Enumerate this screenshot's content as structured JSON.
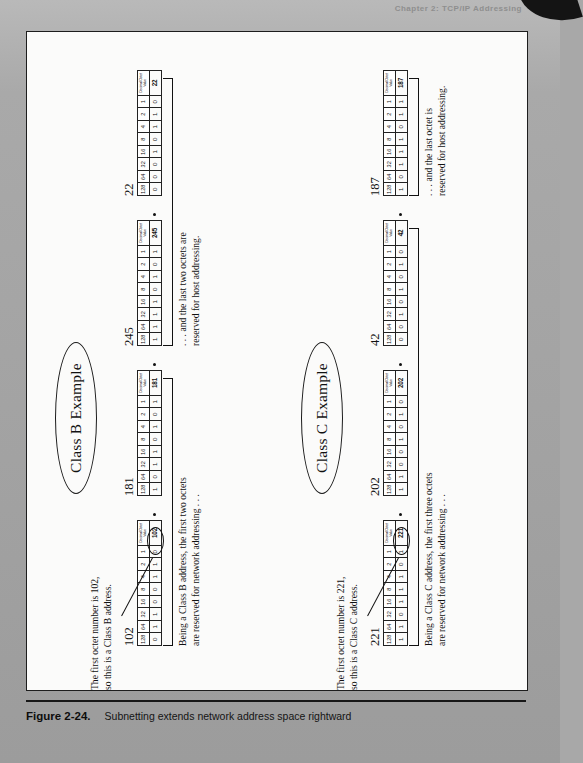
{
  "page": {
    "running_head": "Chapter 2:  TCP/IP Addressing",
    "background_color": "#a8a8a8"
  },
  "caption": {
    "figure_number": "Figure 2-24.",
    "text": "Subnetting extends network address space rightward"
  },
  "bit_header": [
    "128",
    "64",
    "32",
    "16",
    "8",
    "4",
    "2",
    "1"
  ],
  "decimal_header": "Decimal Octet Value",
  "examples": [
    {
      "id": "class-b",
      "oval_label": "Class B Example",
      "callout_note": "The first octet number is 102,\nso this is a Class B address.",
      "left_bracket_note": "Being a Class B address, the first two octets\nare reserved for network addressing . . .",
      "right_bracket_note": ". . . and the last two octets are\nreserved for host addressing.",
      "octets": [
        {
          "decimal": "102",
          "bits": [
            "0",
            "1",
            "1",
            "0",
            "0",
            "1",
            "1",
            "0"
          ],
          "highlighted": true
        },
        {
          "decimal": "181",
          "bits": [
            "1",
            "0",
            "1",
            "1",
            "0",
            "1",
            "0",
            "1"
          ],
          "highlighted": false
        },
        {
          "decimal": "245",
          "bits": [
            "1",
            "1",
            "1",
            "1",
            "0",
            "1",
            "0",
            "1"
          ],
          "highlighted": false
        },
        {
          "decimal": "22",
          "bits": [
            "0",
            "0",
            "0",
            "1",
            "0",
            "1",
            "1",
            "0"
          ],
          "highlighted": false
        }
      ],
      "network_octets": 2,
      "host_octets": 2
    },
    {
      "id": "class-c",
      "oval_label": "Class C Example",
      "callout_note": "The first octet number is 221,\nso this is a Class C address.",
      "left_bracket_note": "Being a Class C address, the first three octets\nare reserved for network addressing . . .",
      "right_bracket_note": ". . . and the last octet is\nreserved for host addressing.",
      "octets": [
        {
          "decimal": "221",
          "bits": [
            "1",
            "1",
            "0",
            "1",
            "1",
            "1",
            "0",
            "1"
          ],
          "highlighted": true
        },
        {
          "decimal": "202",
          "bits": [
            "1",
            "1",
            "0",
            "0",
            "1",
            "0",
            "1",
            "0"
          ],
          "highlighted": false
        },
        {
          "decimal": "42",
          "bits": [
            "0",
            "0",
            "1",
            "0",
            "1",
            "0",
            "1",
            "0"
          ],
          "highlighted": false
        },
        {
          "decimal": "187",
          "bits": [
            "1",
            "0",
            "1",
            "1",
            "1",
            "0",
            "1",
            "1"
          ],
          "highlighted": false
        }
      ],
      "network_octets": 3,
      "host_octets": 1
    }
  ]
}
